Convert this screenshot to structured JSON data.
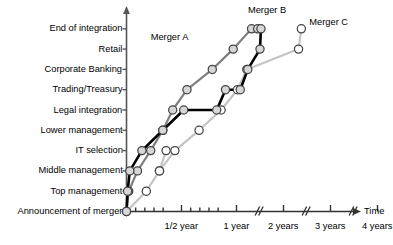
{
  "chart_data": {
    "type": "line",
    "title": "",
    "xlabel": "Time",
    "ylabel": "",
    "grid": false,
    "legend_position": "inline-annotation",
    "categories": [
      "Announcement of merger",
      "Top management",
      "Middle management",
      "IT selection",
      "Lower management",
      "Legal integration",
      "Trading/Treasury",
      "Corporate Banking",
      "Retail",
      "End of integration"
    ],
    "xticks": [
      {
        "label": "",
        "x": 0.0
      },
      {
        "label": "",
        "x": 0.0833
      },
      {
        "label": "",
        "x": 0.1667
      },
      {
        "label": "",
        "x": 0.25
      },
      {
        "label": "",
        "x": 0.3333
      },
      {
        "label": "1/2 year",
        "x": 0.5
      },
      {
        "label": "",
        "x": 0.5833
      },
      {
        "label": "",
        "x": 0.6667
      },
      {
        "label": "",
        "x": 0.75
      },
      {
        "label": "",
        "x": 0.8333
      },
      {
        "label": "1 year",
        "x": 1.0
      },
      {
        "label": "2 years",
        "x": 2.0
      },
      {
        "label": "3 years",
        "x": 3.0
      },
      {
        "label": "4 years",
        "x": 4.0
      }
    ],
    "axis_breaks": [
      1.45,
      2.45,
      3.45
    ],
    "series": [
      {
        "name": "Merger A",
        "color": "#808080",
        "points": [
          {
            "x": 0.0,
            "y": 0
          },
          {
            "x": 0.02,
            "y": 1
          },
          {
            "x": 0.1,
            "y": 2
          },
          {
            "x": 0.22,
            "y": 3
          },
          {
            "x": 0.33,
            "y": 4
          },
          {
            "x": 0.42,
            "y": 5
          },
          {
            "x": 0.55,
            "y": 6
          },
          {
            "x": 0.78,
            "y": 7
          },
          {
            "x": 0.97,
            "y": 8
          },
          {
            "x": 1.32,
            "y": 9
          },
          {
            "x": 1.45,
            "y": 9
          }
        ]
      },
      {
        "name": "Merger B",
        "color": "#000000",
        "points": [
          {
            "x": 0.0,
            "y": 0
          },
          {
            "x": 0.01,
            "y": 1
          },
          {
            "x": 0.03,
            "y": 2
          },
          {
            "x": 0.14,
            "y": 3
          },
          {
            "x": 0.33,
            "y": 4
          },
          {
            "x": 0.52,
            "y": 5
          },
          {
            "x": 0.82,
            "y": 5
          },
          {
            "x": 0.9,
            "y": 6
          },
          {
            "x": 1.08,
            "y": 6
          },
          {
            "x": 1.24,
            "y": 7
          },
          {
            "x": 1.5,
            "y": 8
          },
          {
            "x": 1.52,
            "y": 9
          }
        ]
      },
      {
        "name": "Merger C",
        "color": "#c4c4c4",
        "points": [
          {
            "x": 0.0,
            "y": 0
          },
          {
            "x": 0.18,
            "y": 1
          },
          {
            "x": 0.3,
            "y": 2
          },
          {
            "x": 0.36,
            "y": 3
          },
          {
            "x": 0.3,
            "y": 2
          },
          {
            "x": 0.44,
            "y": 3
          },
          {
            "x": 0.66,
            "y": 4
          },
          {
            "x": 0.86,
            "y": 5
          },
          {
            "x": 1.02,
            "y": 6
          },
          {
            "x": 1.22,
            "y": 7
          },
          {
            "x": 2.32,
            "y": 8
          },
          {
            "x": 2.38,
            "y": 9
          }
        ]
      }
    ],
    "annotations": [
      {
        "text": "Merger A",
        "x": 0.22,
        "y": 8.55
      },
      {
        "text": "Merger B",
        "x": 1.18,
        "y": 9.92
      },
      {
        "text": "Merger C",
        "x": 2.55,
        "y": 9.32
      }
    ]
  }
}
